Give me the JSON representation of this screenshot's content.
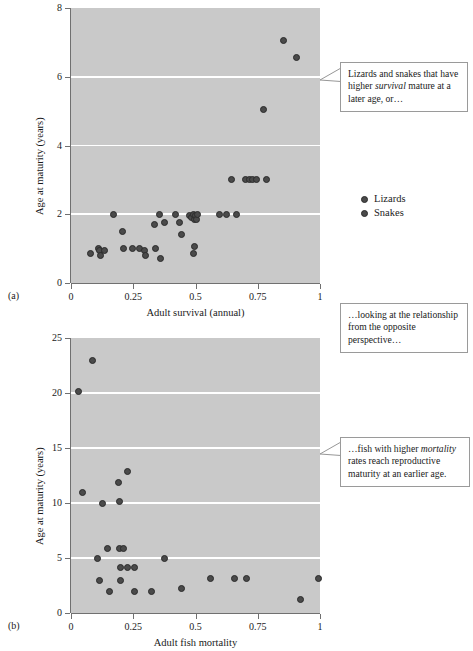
{
  "figure": {
    "marker_color": "#4a4a4a",
    "plot_background": "#c9c9c9",
    "gridline_color": "#ffffff"
  },
  "legend": {
    "items": [
      {
        "label": "Lizards"
      },
      {
        "label": "Snakes"
      }
    ]
  },
  "callouts": {
    "one": {
      "part1": "Lizards and snakes that have higher ",
      "emphasis": "survival",
      "part2": " mature at a later age, or…"
    },
    "two": {
      "text": "…looking at the relationship from the opposite perspective…"
    },
    "three": {
      "part1": "…fish with higher ",
      "emphasis": "mortality",
      "part2": " rates reach reproductive maturity at an earlier age."
    }
  },
  "panel_a": {
    "tag": "(a)"
  },
  "panel_b": {
    "tag": "(b)"
  },
  "chart_data": [
    {
      "type": "scatter",
      "panel": "(a)",
      "title": "",
      "xlabel": "Adult survival (annual)",
      "ylabel": "Age at maturity (years)",
      "xlim": [
        0,
        1
      ],
      "ylim": [
        0,
        8
      ],
      "xticks": [
        0,
        0.25,
        0.5,
        0.75,
        1
      ],
      "xticklabels": [
        "0",
        "0.25",
        "0.5",
        "0.75",
        "1"
      ],
      "yticks": [
        0,
        2,
        4,
        6,
        8
      ],
      "yticklabels": [
        "0",
        "2",
        "4",
        "6",
        "8"
      ],
      "gridlines_y": [
        2,
        4,
        6
      ],
      "grid": true,
      "legend": [
        "Lizards",
        "Snakes"
      ],
      "legend_position": "right",
      "points": [
        [
          0.08,
          0.85
        ],
        [
          0.11,
          1.0
        ],
        [
          0.115,
          0.95
        ],
        [
          0.12,
          0.8
        ],
        [
          0.135,
          0.95
        ],
        [
          0.17,
          2.0
        ],
        [
          0.205,
          1.5
        ],
        [
          0.21,
          1.0
        ],
        [
          0.245,
          1.0
        ],
        [
          0.275,
          1.0
        ],
        [
          0.295,
          0.95
        ],
        [
          0.3,
          0.8
        ],
        [
          0.335,
          1.7
        ],
        [
          0.34,
          1.0
        ],
        [
          0.355,
          2.0
        ],
        [
          0.36,
          0.7
        ],
        [
          0.375,
          1.75
        ],
        [
          0.42,
          2.0
        ],
        [
          0.435,
          1.75
        ],
        [
          0.445,
          1.4
        ],
        [
          0.475,
          1.95
        ],
        [
          0.485,
          1.9
        ],
        [
          0.49,
          2.0
        ],
        [
          0.495,
          1.85
        ],
        [
          0.5,
          1.95
        ],
        [
          0.495,
          1.05
        ],
        [
          0.49,
          0.85
        ],
        [
          0.505,
          1.85
        ],
        [
          0.51,
          2.0
        ],
        [
          0.595,
          2.0
        ],
        [
          0.625,
          2.0
        ],
        [
          0.665,
          2.0
        ],
        [
          0.645,
          3.0
        ],
        [
          0.7,
          3.0
        ],
        [
          0.715,
          3.0
        ],
        [
          0.73,
          3.0
        ],
        [
          0.745,
          3.0
        ],
        [
          0.785,
          3.0
        ],
        [
          0.775,
          5.05
        ],
        [
          0.855,
          7.05
        ],
        [
          0.905,
          6.55
        ]
      ]
    },
    {
      "type": "scatter",
      "panel": "(b)",
      "title": "",
      "xlabel": "Adult fish mortality",
      "ylabel": "Age at maturity (years)",
      "xlim": [
        0,
        1
      ],
      "ylim": [
        0,
        25
      ],
      "xticks": [
        0,
        0.25,
        0.5,
        0.75,
        1
      ],
      "xticklabels": [
        "0",
        "0.25",
        "0.5",
        "0.75",
        "1"
      ],
      "yticks": [
        0,
        5,
        10,
        15,
        20,
        25
      ],
      "yticklabels": [
        "0",
        "5",
        "10",
        "15",
        "20",
        "25"
      ],
      "gridlines_y": [
        5,
        10,
        15,
        20
      ],
      "grid": true,
      "points": [
        [
          0.03,
          20.1
        ],
        [
          0.085,
          23.0
        ],
        [
          0.045,
          11.0
        ],
        [
          0.125,
          10.0
        ],
        [
          0.19,
          11.9
        ],
        [
          0.195,
          10.1
        ],
        [
          0.225,
          12.9
        ],
        [
          0.105,
          5.0
        ],
        [
          0.145,
          5.9
        ],
        [
          0.195,
          5.9
        ],
        [
          0.21,
          5.9
        ],
        [
          0.115,
          3.0
        ],
        [
          0.2,
          4.1
        ],
        [
          0.225,
          4.1
        ],
        [
          0.255,
          4.1
        ],
        [
          0.2,
          3.0
        ],
        [
          0.155,
          2.0
        ],
        [
          0.255,
          2.0
        ],
        [
          0.325,
          2.0
        ],
        [
          0.375,
          5.0
        ],
        [
          0.445,
          2.2
        ],
        [
          0.56,
          3.1
        ],
        [
          0.655,
          3.1
        ],
        [
          0.705,
          3.1
        ],
        [
          0.92,
          1.2
        ],
        [
          0.995,
          3.1
        ]
      ]
    }
  ]
}
